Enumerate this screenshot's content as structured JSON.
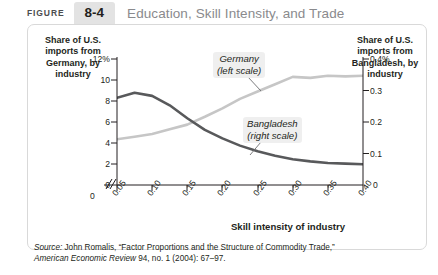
{
  "header": {
    "figure_word": "FIGURE",
    "figure_number": "8-4",
    "title": "Education, Skill Intensity, and Trade"
  },
  "axes": {
    "left_title": "Share of U.S. imports from Germany, by industry",
    "right_title": "Share of U.S. imports from Bangladesh, by industry",
    "x_title": "Skill intensity of industry",
    "left_ticks": [
      "12%",
      "10",
      "8",
      "6",
      "4",
      "2",
      "0"
    ],
    "right_ticks": [
      "0.4%",
      "0.3",
      "0.2",
      "0.1",
      "0"
    ],
    "x_origin_tick": "0",
    "x_ticks": [
      "0.05",
      "0.10",
      "0.15",
      "0.20",
      "0.25",
      "0.30",
      "0.35",
      "0.40"
    ],
    "break_mark": "axis-break"
  },
  "series_labels": {
    "germany": "Germany\n(left scale)",
    "germany_line1": "Germany",
    "germany_line2": "(left scale)",
    "bangladesh_line1": "Bangladesh",
    "bangladesh_line2": "(right scale)"
  },
  "source": {
    "prefix": "Source:",
    "line1_rest": " John Romalis, “Factor Proportions and the Structure of Commodity Trade,”",
    "line2_italic": "American Economic Review",
    "line2_rest": " 94, no. 1 (2004): 67–97."
  },
  "colors": {
    "germany_line": "#c6c6c6",
    "bangladesh_line": "#58595b",
    "axis": "#231f20",
    "panel_border": "#d9d9d9",
    "badge_bg": "#e3e3e3",
    "title_gray": "#8a8a8d"
  },
  "chart_data": {
    "type": "line",
    "title": "Education, Skill Intensity, and Trade",
    "xlabel": "Skill intensity of industry",
    "ylabel": "Share of U.S. imports from Germany, by industry",
    "y2label": "Share of U.S. imports from Bangladesh, by industry",
    "xlim": [
      0.05,
      0.4
    ],
    "ylim": [
      0,
      12
    ],
    "y2lim": [
      0,
      0.4
    ],
    "ytick_values": [
      0,
      2,
      4,
      6,
      8,
      10,
      12
    ],
    "y2tick_values": [
      0,
      0.1,
      0.2,
      0.3,
      0.4
    ],
    "xtick_values": [
      0.05,
      0.1,
      0.15,
      0.2,
      0.25,
      0.3,
      0.35,
      0.4
    ],
    "grid": false,
    "legend_position": "inline-annotations",
    "x": [
      0.05,
      0.075,
      0.1,
      0.125,
      0.15,
      0.175,
      0.2,
      0.225,
      0.25,
      0.275,
      0.3,
      0.325,
      0.35,
      0.375,
      0.4
    ],
    "series": [
      {
        "name": "Germany (left scale)",
        "axis": "left",
        "unit": "%",
        "color": "#c6c6c6",
        "values": [
          4.35,
          4.6,
          4.85,
          5.3,
          5.75,
          6.5,
          7.3,
          8.2,
          8.9,
          9.6,
          10.3,
          10.2,
          10.4,
          10.35,
          10.4
        ]
      },
      {
        "name": "Bangladesh (right scale)",
        "axis": "right",
        "unit": "%",
        "color": "#58595b",
        "values": [
          0.277,
          0.293,
          0.283,
          0.253,
          0.212,
          0.175,
          0.148,
          0.125,
          0.107,
          0.093,
          0.082,
          0.075,
          0.07,
          0.068,
          0.066
        ]
      }
    ]
  }
}
